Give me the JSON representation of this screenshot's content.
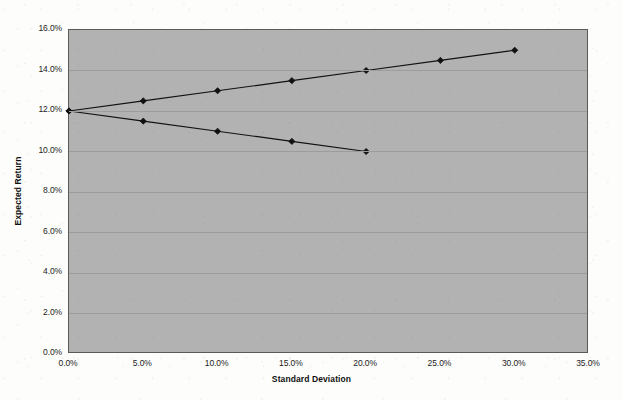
{
  "chart_data": {
    "type": "line",
    "title": "",
    "xlabel": "Standard Deviation",
    "ylabel": "Expected Return",
    "xlim": [
      0,
      35
    ],
    "ylim": [
      0,
      16
    ],
    "xtick_labels": [
      "0.0%",
      "5.0%",
      "10.0%",
      "15.0%",
      "20.0%",
      "25.0%",
      "30.0%",
      "35.0%"
    ],
    "xticks": [
      0,
      5,
      10,
      15,
      20,
      25,
      30,
      35
    ],
    "ytick_labels": [
      "0.0%",
      "2.0%",
      "4.0%",
      "6.0%",
      "8.0%",
      "10.0%",
      "12.0%",
      "14.0%",
      "16.0%"
    ],
    "yticks": [
      0,
      2,
      4,
      6,
      8,
      10,
      12,
      14,
      16
    ],
    "grid": "horizontal",
    "legend": "none",
    "plot_background_color": "#b2b2b2",
    "page_background_color": "#fdfdfb",
    "line_color": "#111111",
    "marker": "diamond",
    "marker_color": "#111111",
    "series": [
      {
        "name": "upper-frontier",
        "x": [
          0,
          5,
          10,
          15,
          20,
          25,
          30
        ],
        "values": [
          12.0,
          12.5,
          13.0,
          13.5,
          14.0,
          14.5,
          15.0
        ]
      },
      {
        "name": "lower-frontier",
        "x": [
          0,
          5,
          10,
          15,
          20
        ],
        "values": [
          12.0,
          11.5,
          11.0,
          10.5,
          10.0
        ]
      }
    ]
  }
}
